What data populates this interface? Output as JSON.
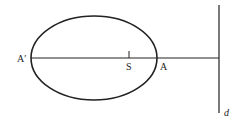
{
  "diagram": {
    "type": "ellipse-with-directrix",
    "labels": {
      "a_prime": "A′",
      "focus": "S",
      "vertex": "A",
      "directrix": "d"
    },
    "colors": {
      "stroke": "#222222",
      "background": "#ffffff"
    }
  }
}
